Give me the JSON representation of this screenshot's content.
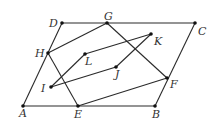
{
  "diagram": {
    "type": "geometry",
    "points": [
      {
        "name": "A",
        "x": 23,
        "y": 106,
        "label_dx": -4,
        "label_dy": 11
      },
      {
        "name": "B",
        "x": 155,
        "y": 106,
        "label_dx": -3,
        "label_dy": 12
      },
      {
        "name": "C",
        "x": 195,
        "y": 23,
        "label_dx": 3,
        "label_dy": 12
      },
      {
        "name": "D",
        "x": 62,
        "y": 23,
        "label_dx": -13,
        "label_dy": 4
      },
      {
        "name": "E",
        "x": 78,
        "y": 106,
        "label_dx": -4,
        "label_dy": 12
      },
      {
        "name": "F",
        "x": 167,
        "y": 78,
        "label_dx": 3,
        "label_dy": 10
      },
      {
        "name": "G",
        "x": 107,
        "y": 23,
        "label_dx": -3,
        "label_dy": -3
      },
      {
        "name": "H",
        "x": 48,
        "y": 53,
        "label_dx": -13,
        "label_dy": 4
      },
      {
        "name": "I",
        "x": 51,
        "y": 87,
        "label_dx": -10,
        "label_dy": 5
      },
      {
        "name": "J",
        "x": 116,
        "y": 67,
        "label_dx": -1,
        "label_dy": 11
      },
      {
        "name": "K",
        "x": 151,
        "y": 34,
        "label_dx": 3,
        "label_dy": 11
      },
      {
        "name": "L",
        "x": 85,
        "y": 54,
        "label_dx": 0,
        "label_dy": 11
      }
    ],
    "segments": [
      [
        "A",
        "B"
      ],
      [
        "B",
        "C"
      ],
      [
        "C",
        "D"
      ],
      [
        "D",
        "A"
      ],
      [
        "H",
        "G"
      ],
      [
        "G",
        "F"
      ],
      [
        "F",
        "E"
      ],
      [
        "E",
        "H"
      ],
      [
        "I",
        "L"
      ],
      [
        "L",
        "K"
      ],
      [
        "K",
        "J"
      ],
      [
        "J",
        "I"
      ]
    ]
  }
}
